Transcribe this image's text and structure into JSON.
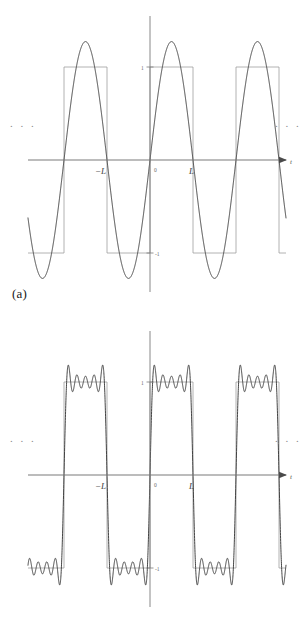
{
  "figure": {
    "title": "",
    "background": "#ffffff",
    "width": 307,
    "height": 631
  },
  "panels": [
    {
      "id": "a",
      "caption": "(a)",
      "ellipsis_left": ". . .",
      "ellipsis_right": ". . .",
      "axis_name": "t",
      "x_ticks": [
        {
          "label": "−L",
          "value": -1
        },
        {
          "label": "0",
          "value": 0
        },
        {
          "label": "L",
          "value": 1
        }
      ],
      "y_ticks": [
        {
          "label": "1",
          "value": 1
        },
        {
          "label": "-1",
          "value": -1
        }
      ]
    },
    {
      "id": "b",
      "caption": "(b)",
      "ellipsis_left": ". . .",
      "ellipsis_right": ". . .",
      "axis_name": "t",
      "x_ticks": [
        {
          "label": "−L",
          "value": -1
        },
        {
          "label": "0",
          "value": 0
        },
        {
          "label": "L",
          "value": 1
        }
      ],
      "y_ticks": [
        {
          "label": "1",
          "value": 1
        },
        {
          "label": "-1",
          "value": -1
        }
      ]
    }
  ],
  "colors": {
    "curve": "#3a3a3a",
    "square": "#9a9a9a",
    "axis": "#7a7a7a",
    "text": "#3d3d3d",
    "faint_text": "#8a8a8a",
    "background": "#ffffff"
  },
  "chart_data": [
    {
      "type": "line",
      "title": "",
      "subtitle": "Fourier partial sum approximation of a square wave (first term)",
      "xlabel": "t",
      "ylabel": "",
      "xlim": [
        -3,
        3
      ],
      "ylim": [
        -1.35,
        1.35
      ],
      "grid": false,
      "legend": null,
      "annotations": [
        ". . .",
        ". . ."
      ],
      "series": [
        {
          "name": "square-wave",
          "kind": "square",
          "period": 2,
          "amplitude": 1,
          "description": "Reference square wave of period 2L alternating between +1 and -1"
        },
        {
          "name": "fourier-partial-sum",
          "kind": "fourier-odd-harmonics",
          "n_terms": 1,
          "harmonics": [
            1
          ],
          "coefficients": [
            1.2732
          ],
          "description": "S1(t) = (4/pi) sin(pi t / L)"
        }
      ]
    },
    {
      "type": "line",
      "title": "",
      "subtitle": "Fourier partial sum approximation of a square wave (five terms)",
      "xlabel": "t",
      "ylabel": "",
      "xlim": [
        -3,
        3
      ],
      "ylim": [
        -1.35,
        1.35
      ],
      "grid": false,
      "legend": null,
      "annotations": [
        ". . .",
        ". . ."
      ],
      "series": [
        {
          "name": "square-wave",
          "kind": "square",
          "period": 2,
          "amplitude": 1,
          "description": "Reference square wave of period 2L alternating between +1 and -1"
        },
        {
          "name": "fourier-partial-sum",
          "kind": "fourier-odd-harmonics",
          "n_terms": 5,
          "harmonics": [
            1,
            3,
            5,
            7,
            9
          ],
          "coefficients": [
            1.2732,
            0.4244,
            0.2546,
            0.1819,
            0.1415
          ],
          "description": "S9(t) = (4/pi) sum_{k odd, k<=9} sin(k pi t / L)/k"
        }
      ]
    }
  ],
  "geometry": {
    "panel_a": {
      "x_axis_y": 160,
      "y_axis_x": 150,
      "y_axis_top": 16,
      "y_axis_bottom": 292,
      "x_axis_left": 28,
      "x_axis_right": 286,
      "unit_x": 43,
      "unit_y": 93
    },
    "panel_b": {
      "x_axis_y": 160,
      "y_axis_x": 150,
      "y_axis_top": 16,
      "y_axis_bottom": 292,
      "x_axis_left": 28,
      "x_axis_right": 286,
      "unit_x": 43,
      "unit_y": 93
    }
  }
}
